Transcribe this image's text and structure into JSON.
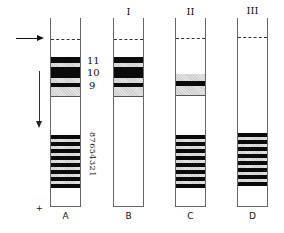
{
  "diagram": {
    "type": "gel-electrophoresis-tubes",
    "tubes": [
      {
        "letter": "A",
        "roman": "",
        "upper_bands": [
          "11",
          "10",
          "9"
        ],
        "lower_bands": [
          "8",
          "7",
          "6",
          "5",
          "4",
          "3",
          "2",
          "1"
        ]
      },
      {
        "letter": "B",
        "roman": "I",
        "upper_bands": [
          "11",
          "10",
          "9"
        ],
        "lower_bands": []
      },
      {
        "letter": "C",
        "roman": "II",
        "upper_bands": [
          "9"
        ],
        "lower_bands": [
          "8",
          "7",
          "6",
          "5",
          "4",
          "3",
          "2",
          "1"
        ]
      },
      {
        "letter": "D",
        "roman": "III",
        "upper_bands": [],
        "lower_bands": [
          "8",
          "7",
          "6",
          "5",
          "4",
          "3",
          "2",
          "1"
        ]
      }
    ],
    "band_labels": {
      "upper": [
        "11",
        "10",
        "9"
      ],
      "lower_vertical_text": "87654321"
    },
    "electrode_sign": "+",
    "colors": {
      "band_dark": "#0a0a0a",
      "band_light": "#d8d8d8",
      "tube_outline": "#666666"
    }
  }
}
